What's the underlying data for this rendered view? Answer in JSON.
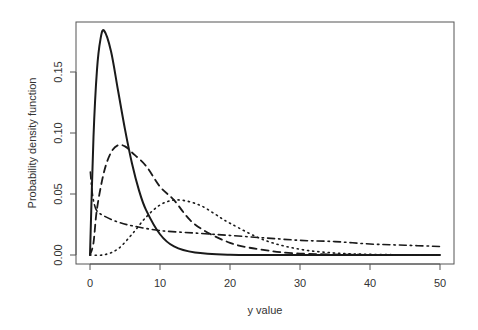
{
  "chart_data": {
    "type": "line",
    "title": "",
    "xlabel": "y value",
    "ylabel": "Probability density function",
    "xlim": [
      0,
      50
    ],
    "ylim": [
      0,
      0.185
    ],
    "xticks": [
      "0",
      "10",
      "20",
      "30",
      "40",
      "50"
    ],
    "yticks": [
      "0.00",
      "0.05",
      "0.10",
      "0.15"
    ],
    "grid": false,
    "legend": null,
    "series": [
      {
        "name": "solid",
        "line_style": "solid",
        "x": [
          0,
          0.5,
          1,
          1.5,
          2,
          3,
          4,
          5,
          6,
          7,
          8,
          10,
          12,
          15,
          20,
          25,
          30,
          40,
          50
        ],
        "values": [
          0,
          0.097,
          0.152,
          0.177,
          0.184,
          0.167,
          0.135,
          0.103,
          0.075,
          0.053,
          0.037,
          0.017,
          0.007,
          0.002,
          0.0002,
          0,
          0,
          0,
          0
        ]
      },
      {
        "name": "dashed",
        "line_style": "dashed",
        "x": [
          0,
          0.5,
          1,
          2,
          3,
          4,
          5,
          6,
          8,
          10,
          12,
          15,
          20,
          25,
          30,
          40,
          50
        ],
        "values": [
          0,
          0.01,
          0.038,
          0.068,
          0.084,
          0.09,
          0.089,
          0.084,
          0.073,
          0.056,
          0.045,
          0.025,
          0.01,
          0.004,
          0.0012,
          0.0001,
          0
        ]
      },
      {
        "name": "dotted",
        "line_style": "dotted",
        "x": [
          0,
          2,
          4,
          6,
          8,
          10,
          12,
          14,
          16,
          18,
          20,
          25,
          30,
          35,
          40,
          45,
          50
        ],
        "values": [
          0,
          0.0002,
          0.005,
          0.017,
          0.031,
          0.041,
          0.045,
          0.044,
          0.04,
          0.033,
          0.026,
          0.012,
          0.0047,
          0.0016,
          0.0005,
          0.0002,
          0.0001
        ]
      },
      {
        "name": "dash-dot",
        "line_style": "dashdot",
        "x": [
          0.05,
          0.3,
          0.6,
          1,
          2,
          4,
          6,
          10,
          15,
          20,
          25,
          30,
          35,
          40,
          45,
          50
        ],
        "values": [
          0.068,
          0.052,
          0.042,
          0.036,
          0.032,
          0.027,
          0.024,
          0.02,
          0.018,
          0.016,
          0.014,
          0.012,
          0.011,
          0.009,
          0.008,
          0.007
        ]
      }
    ]
  },
  "axes": {
    "x_title": "y value",
    "y_title": "Probability density function",
    "x_ticks": [
      "0",
      "10",
      "20",
      "30",
      "40",
      "50"
    ],
    "y_ticks": [
      "0.00",
      "0.05",
      "0.10",
      "0.15"
    ]
  },
  "colors": {
    "line": "#1a1a1a",
    "axis": "#555555",
    "text": "#333333",
    "background": "#ffffff"
  }
}
